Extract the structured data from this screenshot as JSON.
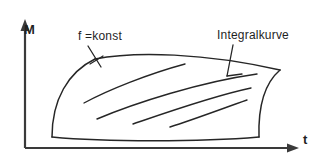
{
  "figure": {
    "type": "diagram",
    "background_color": "#ffffff",
    "line_color": "#262626",
    "axis_color": "#3a3a3a"
  },
  "axes": {
    "origin": {
      "x": 25,
      "y": 148
    },
    "vertical": {
      "label": "M",
      "icon": "up-arrow-icon",
      "from": {
        "x": 25,
        "y": 148
      },
      "to": {
        "x": 25,
        "y": 22
      }
    },
    "horizontal": {
      "label": "t",
      "icon": "right-arrow-icon",
      "from": {
        "x": 25,
        "y": 148
      },
      "to": {
        "x": 297,
        "y": 148
      }
    }
  },
  "annotations": [
    {
      "name": "f-konst",
      "label": "f =konst",
      "text_position": {
        "x": 78,
        "y": 30
      },
      "leader_from": {
        "x": 88,
        "y": 46
      },
      "leader_to": {
        "x": 100,
        "y": 66
      }
    },
    {
      "name": "integralkurve",
      "label": "Integralkurve",
      "text_position": {
        "x": 217,
        "y": 29
      },
      "leader_from": {
        "x": 233,
        "y": 45
      },
      "leader_to": {
        "x": 227,
        "y": 76
      }
    }
  ],
  "region": {
    "name": "bounded-region",
    "corners": {
      "top_left": {
        "x": 95,
        "y": 59
      },
      "top_right": {
        "x": 280,
        "y": 70
      },
      "bottom_right": {
        "x": 259,
        "y": 137
      },
      "bottom_left": {
        "x": 52,
        "y": 137
      }
    },
    "edges": [
      {
        "name": "top-edge",
        "shape": "arc-bulging-up"
      },
      {
        "name": "right-edge",
        "shape": "arc-bulging-left"
      },
      {
        "name": "bottom-edge",
        "shape": "arc-sagging-down"
      },
      {
        "name": "left-edge",
        "shape": "arc-bulging-left"
      }
    ]
  },
  "integral_curves": {
    "count": 4,
    "shape": "arcs-rising-to-the-right",
    "curves": [
      {
        "start": {
          "x": 84,
          "y": 103
        },
        "end": {
          "x": 185,
          "y": 64
        }
      },
      {
        "start": {
          "x": 97,
          "y": 119
        },
        "end": {
          "x": 257,
          "y": 74
        }
      },
      {
        "start": {
          "x": 133,
          "y": 124
        },
        "end": {
          "x": 251,
          "y": 88
        }
      },
      {
        "start": {
          "x": 170,
          "y": 127
        },
        "end": {
          "x": 247,
          "y": 100
        }
      }
    ]
  }
}
